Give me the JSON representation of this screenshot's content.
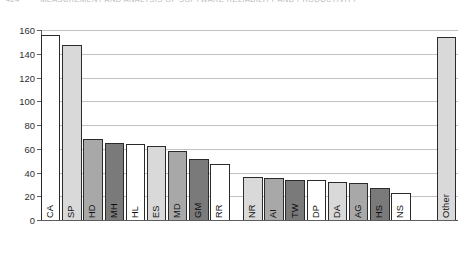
{
  "page_header": {
    "page_number": "424",
    "running_title": "MEASUREMENT AND ANALYSIS OF SOFTWARE RELIABILITY AND PRODUCTIVITY"
  },
  "chart_data": {
    "type": "bar",
    "title": "",
    "subtitle": "",
    "xlabel": "",
    "ylabel": "",
    "ylim": [
      0,
      160
    ],
    "ytick_step": 20,
    "ytick_labels": [
      "0",
      "20",
      "40",
      "60",
      "80",
      "100",
      "120",
      "140",
      "160"
    ],
    "grid": true,
    "legend": null,
    "categories": [
      "CA",
      "SP",
      "HD",
      "MH",
      "HL",
      "ES",
      "MD",
      "GM",
      "RR",
      "NR",
      "AI",
      "TW",
      "DP",
      "DA",
      "AG",
      "HS",
      "NS",
      "Other"
    ],
    "values": [
      156,
      147,
      68,
      65,
      64,
      62,
      58,
      51,
      47,
      36,
      35,
      34,
      34,
      32,
      31,
      27,
      23,
      154
    ],
    "bar_fills": [
      "#ffffff",
      "#d9d9d9",
      "#a8a8a8",
      "#7a7a7a",
      "#ffffff",
      "#d9d9d9",
      "#a8a8a8",
      "#7a7a7a",
      "#ffffff",
      "#d9d9d9",
      "#a8a8a8",
      "#7a7a7a",
      "#ffffff",
      "#d9d9d9",
      "#a8a8a8",
      "#7a7a7a",
      "#ffffff",
      "#d9d9d9"
    ],
    "gaps_after": [
      8,
      16
    ],
    "bar_outline_color": "#2b2b2b",
    "gridline_color": "#c2c2c2",
    "axis_color": "#5d5d5d"
  }
}
